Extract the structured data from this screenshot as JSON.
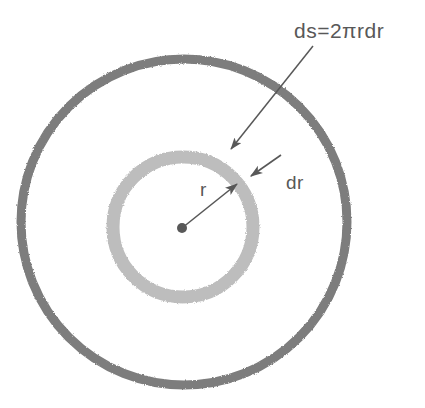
{
  "figure": {
    "background_color": "#ffffff",
    "width": 425,
    "height": 408,
    "labels": {
      "area_element": "ds=2πrdr",
      "thickness": "dr",
      "radius": "r"
    },
    "icons": {
      "center_point": "center-dot-icon",
      "arrow_area": "arrow-icon",
      "arrow_thickness": "arrow-icon",
      "arrow_radius": "arrow-icon"
    },
    "colors": {
      "outer_circle": "#7d7d7d",
      "annulus_ring": "#bdbdbd",
      "annotation": "#585858",
      "center_dot": "#585858"
    },
    "geometry": {
      "outer_circle": {
        "cx": 184,
        "cy": 222,
        "r": 163,
        "stroke_width": 9
      },
      "annulus_ring": {
        "cx": 183,
        "cy": 227,
        "r": 70,
        "stroke_width": 13
      },
      "center_dot": {
        "cx": 182,
        "cy": 228,
        "r": 5
      },
      "radius_arrow": {
        "x1": 182,
        "y1": 228,
        "x2": 237,
        "y2": 184
      },
      "area_arrow": {
        "x1": 313,
        "y1": 46,
        "x2": 231,
        "y2": 149
      },
      "thickness_arrow": {
        "x1": 280,
        "y1": 156,
        "x2": 251,
        "y2": 176
      },
      "label_area_pos": {
        "x": 294,
        "y": 38
      },
      "label_thickness_pos": {
        "x": 286,
        "y": 189
      },
      "label_radius_pos": {
        "x": 200,
        "y": 196
      }
    }
  }
}
